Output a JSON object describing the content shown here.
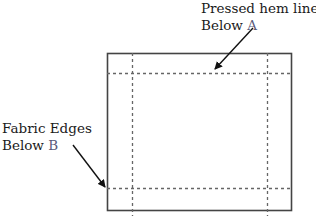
{
  "diagram": {
    "title": "",
    "labels": {
      "a": {
        "line1": "Pressed hem lines",
        "line2_prefix": "Below ",
        "line2_letter": "A"
      },
      "b": {
        "line1": "Fabric Edges",
        "line2_prefix": "Below ",
        "line2_letter": "B"
      }
    },
    "shapes": {
      "fabric_outline": "solid rectangle (fabric edges)",
      "hem_lines": "dashed lines, two vertical and two horizontal"
    },
    "colors": {
      "outline": "#444444",
      "dashed": "#666666",
      "arrow": "#111111",
      "text": "#1a1a1a",
      "letter": "#5a5a7a"
    }
  }
}
